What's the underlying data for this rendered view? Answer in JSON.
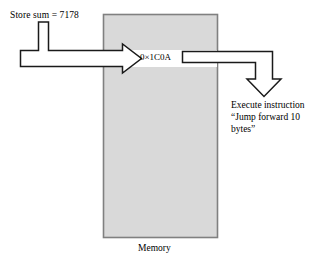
{
  "diagram": {
    "title_caption": "Memory",
    "store_label": "Store sum = 7178",
    "cell_value": "0×1C0A",
    "execute_note": "Execute instruction\n“Jump forward 10\nbytes”",
    "colors": {
      "memory_fill": "#d9d9d9",
      "memory_border": "#808080",
      "stroke": "#1a1a1a",
      "arrow_fill": "#ffffff",
      "background": "#ffffff"
    },
    "memory_block": {
      "x": 103,
      "y": 14,
      "width": 115,
      "height": 224
    },
    "arrows": [
      {
        "name": "store-arrow",
        "direction": "right",
        "from": "store-sum-label",
        "to": "memory-cell"
      },
      {
        "name": "execute-arrow",
        "direction": "down",
        "from": "memory-cell",
        "to": "execute-note"
      }
    ]
  }
}
